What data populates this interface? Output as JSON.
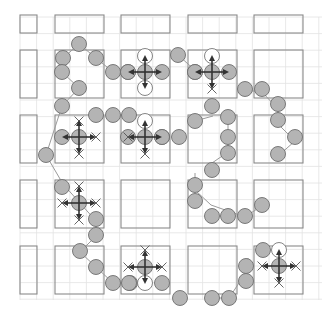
{
  "diagram": {
    "width": 333,
    "height": 325,
    "colors": {
      "background": "#ffffff",
      "grid_line": "#e2e2e2",
      "block_stroke": "#8a8a8a",
      "node_fill": "#b4b4b4",
      "node_stroke": "#6e6e6e",
      "ghost_fill": "#ffffff",
      "ghost_stroke": "#777777",
      "path_line": "#9a9a9a",
      "arrow": "#333333",
      "cross": "#555555"
    },
    "grid": {
      "x0": 20,
      "y0": 17,
      "step": 16.6,
      "x1": 322,
      "y1": 300
    },
    "blocks": [
      {
        "x": 20,
        "y": 15,
        "w": 17,
        "h": 18
      },
      {
        "x": 55,
        "y": 15,
        "w": 49,
        "h": 18
      },
      {
        "x": 121,
        "y": 15,
        "w": 49,
        "h": 18
      },
      {
        "x": 188,
        "y": 15,
        "w": 49,
        "h": 18
      },
      {
        "x": 254,
        "y": 15,
        "w": 49,
        "h": 18
      },
      {
        "x": 20,
        "y": 50,
        "w": 17,
        "h": 48
      },
      {
        "x": 55,
        "y": 50,
        "w": 49,
        "h": 48
      },
      {
        "x": 121,
        "y": 50,
        "w": 49,
        "h": 48
      },
      {
        "x": 188,
        "y": 50,
        "w": 49,
        "h": 48
      },
      {
        "x": 254,
        "y": 50,
        "w": 49,
        "h": 48
      },
      {
        "x": 20,
        "y": 115,
        "w": 17,
        "h": 48
      },
      {
        "x": 55,
        "y": 115,
        "w": 49,
        "h": 48
      },
      {
        "x": 121,
        "y": 115,
        "w": 49,
        "h": 48
      },
      {
        "x": 188,
        "y": 115,
        "w": 49,
        "h": 48
      },
      {
        "x": 254,
        "y": 115,
        "w": 49,
        "h": 48
      },
      {
        "x": 20,
        "y": 180,
        "w": 17,
        "h": 48
      },
      {
        "x": 55,
        "y": 180,
        "w": 49,
        "h": 48
      },
      {
        "x": 121,
        "y": 180,
        "w": 49,
        "h": 48
      },
      {
        "x": 188,
        "y": 180,
        "w": 49,
        "h": 48
      },
      {
        "x": 254,
        "y": 180,
        "w": 49,
        "h": 48
      },
      {
        "x": 20,
        "y": 246,
        "w": 17,
        "h": 48
      },
      {
        "x": 55,
        "y": 246,
        "w": 49,
        "h": 48
      },
      {
        "x": 121,
        "y": 246,
        "w": 49,
        "h": 48
      },
      {
        "x": 188,
        "y": 246,
        "w": 49,
        "h": 48
      },
      {
        "x": 254,
        "y": 246,
        "w": 49,
        "h": 48
      }
    ],
    "path_nodes": [
      [
        63,
        72
      ],
      [
        62,
        88
      ],
      [
        79,
        102
      ],
      [
        79,
        44
      ],
      [
        96,
        58
      ],
      [
        113,
        72
      ],
      [
        295,
        176
      ],
      [
        278,
        192
      ],
      [
        263,
        205
      ],
      [
        245,
        217
      ],
      [
        46,
        168
      ],
      [
        63,
        184
      ],
      [
        96,
        221
      ],
      [
        96,
        236
      ],
      [
        80,
        252
      ],
      [
        96,
        267
      ],
      [
        113,
        283
      ],
      [
        130,
        283
      ],
      [
        179,
        297
      ],
      [
        212,
        298
      ],
      [
        229,
        298
      ],
      [
        245,
        274
      ],
      [
        245,
        266
      ],
      [
        248,
        258
      ],
      [
        264,
        252
      ],
      [
        178,
        55
      ],
      [
        197,
        72
      ],
      [
        245,
        92
      ],
      [
        262,
        92
      ],
      [
        278,
        109
      ],
      [
        278,
        124
      ],
      [
        295,
        141
      ],
      [
        278,
        156
      ],
      [
        213,
        116
      ],
      [
        193,
        121
      ],
      [
        228,
        121
      ],
      [
        228,
        137
      ],
      [
        228,
        152
      ],
      [
        212,
        163
      ],
      [
        195,
        173
      ],
      [
        195,
        190
      ],
      [
        211,
        205
      ],
      [
        96,
        118
      ],
      [
        113,
        118
      ],
      [
        130,
        118
      ],
      [
        146,
        137
      ],
      [
        62,
        140
      ],
      [
        46,
        155
      ]
    ],
    "path_edges": [
      [
        [
          79,
          44
        ],
        [
          63,
          58
        ]
      ],
      [
        [
          79,
          44
        ],
        [
          96,
          58
        ]
      ],
      [
        [
          63,
          58
        ],
        [
          62,
          72
        ]
      ],
      [
        [
          62,
          72
        ],
        [
          79,
          88
        ]
      ],
      [
        [
          79,
          88
        ],
        [
          62,
          106
        ]
      ],
      [
        [
          62,
          106
        ],
        [
          46,
          155
        ]
      ],
      [
        [
          96,
          58
        ],
        [
          113,
          72
        ]
      ],
      [
        [
          178,
          55
        ],
        [
          197,
          72
        ]
      ],
      [
        [
          237,
          89
        ],
        [
          262,
          92
        ]
      ],
      [
        [
          262,
          92
        ],
        [
          278,
          109
        ]
      ],
      [
        [
          278,
          109
        ],
        [
          278,
          124
        ]
      ],
      [
        [
          278,
          124
        ],
        [
          295,
          141
        ]
      ],
      [
        [
          295,
          141
        ],
        [
          278,
          156
        ]
      ],
      [
        [
          46,
          155
        ],
        [
          63,
          184
        ]
      ],
      [
        [
          63,
          184
        ],
        [
          96,
          221
        ]
      ],
      [
        [
          96,
          221
        ],
        [
          96,
          236
        ]
      ],
      [
        [
          96,
          236
        ],
        [
          80,
          252
        ]
      ],
      [
        [
          80,
          252
        ],
        [
          96,
          267
        ]
      ],
      [
        [
          96,
          267
        ],
        [
          113,
          283
        ]
      ],
      [
        [
          213,
          116
        ],
        [
          195,
          121
        ]
      ],
      [
        [
          228,
          121
        ],
        [
          228,
          152
        ]
      ],
      [
        [
          228,
          152
        ],
        [
          212,
          163
        ]
      ],
      [
        [
          195,
          173
        ],
        [
          195,
          190
        ]
      ],
      [
        [
          195,
          190
        ],
        [
          211,
          205
        ]
      ],
      [
        [
          211,
          205
        ],
        [
          245,
          217
        ]
      ],
      [
        [
          245,
          217
        ],
        [
          263,
          205
        ]
      ],
      [
        [
          212,
          298
        ],
        [
          229,
          298
        ]
      ],
      [
        [
          229,
          298
        ],
        [
          245,
          274
        ]
      ],
      [
        [
          245,
          274
        ],
        [
          248,
          258
        ]
      ]
    ],
    "nodes": [
      {
        "x": 79,
        "y": 44
      },
      {
        "x": 63,
        "y": 58
      },
      {
        "x": 96,
        "y": 58
      },
      {
        "x": 62,
        "y": 72
      },
      {
        "x": 79,
        "y": 88
      },
      {
        "x": 62,
        "y": 106
      },
      {
        "x": 113,
        "y": 72
      },
      {
        "x": 128,
        "y": 72
      },
      {
        "x": 178,
        "y": 55
      },
      {
        "x": 195,
        "y": 72
      },
      {
        "x": 245,
        "y": 89
      },
      {
        "x": 262,
        "y": 89
      },
      {
        "x": 278,
        "y": 104
      },
      {
        "x": 278,
        "y": 120
      },
      {
        "x": 295,
        "y": 137
      },
      {
        "x": 278,
        "y": 154
      },
      {
        "x": 212,
        "y": 106
      },
      {
        "x": 195,
        "y": 121
      },
      {
        "x": 228,
        "y": 117
      },
      {
        "x": 228,
        "y": 137
      },
      {
        "x": 228,
        "y": 153
      },
      {
        "x": 212,
        "y": 170
      },
      {
        "x": 195,
        "y": 185
      },
      {
        "x": 195,
        "y": 201
      },
      {
        "x": 212,
        "y": 216
      },
      {
        "x": 228,
        "y": 216
      },
      {
        "x": 245,
        "y": 216
      },
      {
        "x": 262,
        "y": 205
      },
      {
        "x": 96,
        "y": 115
      },
      {
        "x": 113,
        "y": 115
      },
      {
        "x": 129,
        "y": 115
      },
      {
        "x": 179,
        "y": 137
      },
      {
        "x": 46,
        "y": 155
      },
      {
        "x": 62,
        "y": 187
      },
      {
        "x": 96,
        "y": 219
      },
      {
        "x": 96,
        "y": 235
      },
      {
        "x": 80,
        "y": 251
      },
      {
        "x": 96,
        "y": 267
      },
      {
        "x": 113,
        "y": 283
      },
      {
        "x": 130,
        "y": 283
      },
      {
        "x": 180,
        "y": 298
      },
      {
        "x": 212,
        "y": 298
      },
      {
        "x": 229,
        "y": 298
      },
      {
        "x": 246,
        "y": 281
      },
      {
        "x": 246,
        "y": 266
      },
      {
        "x": 263,
        "y": 250
      }
    ],
    "robots": [
      {
        "x": 145,
        "y": 72,
        "ghosts": [
          {
            "x": 145,
            "y": 56
          },
          {
            "x": 145,
            "y": 88
          }
        ],
        "side_nodes": [
          {
            "x": 128,
            "y": 72
          },
          {
            "x": 162,
            "y": 72
          }
        ],
        "crosses": []
      },
      {
        "x": 212,
        "y": 72,
        "ghosts": [
          {
            "x": 212,
            "y": 56
          }
        ],
        "side_nodes": [
          {
            "x": 195,
            "y": 72
          },
          {
            "x": 229,
            "y": 72
          }
        ],
        "crosses": [
          {
            "x": 212,
            "y": 89
          }
        ]
      },
      {
        "x": 79,
        "y": 137,
        "ghosts": [],
        "side_nodes": [
          {
            "x": 62,
            "y": 137
          }
        ],
        "crosses": [
          {
            "x": 79,
            "y": 121
          },
          {
            "x": 79,
            "y": 154
          },
          {
            "x": 96,
            "y": 137
          }
        ]
      },
      {
        "x": 145,
        "y": 137,
        "ghosts": [
          {
            "x": 145,
            "y": 121
          }
        ],
        "side_nodes": [
          {
            "x": 162,
            "y": 137
          }
        ],
        "crosses": [
          {
            "x": 128,
            "y": 137
          },
          {
            "x": 145,
            "y": 154
          }
        ]
      },
      {
        "x": 79,
        "y": 203,
        "ghosts": [],
        "side_nodes": [],
        "crosses": [
          {
            "x": 79,
            "y": 186
          },
          {
            "x": 62,
            "y": 203
          },
          {
            "x": 96,
            "y": 203
          },
          {
            "x": 79,
            "y": 220
          }
        ]
      },
      {
        "x": 145,
        "y": 267,
        "ghosts": [
          {
            "x": 145,
            "y": 283
          }
        ],
        "side_nodes": [
          {
            "x": 162,
            "y": 283
          }
        ],
        "crosses": [
          {
            "x": 145,
            "y": 250
          },
          {
            "x": 128,
            "y": 267
          },
          {
            "x": 162,
            "y": 267
          }
        ]
      },
      {
        "x": 279,
        "y": 266,
        "ghosts": [
          {
            "x": 279,
            "y": 250
          }
        ],
        "side_nodes": [],
        "crosses": [
          {
            "x": 262,
            "y": 266
          },
          {
            "x": 296,
            "y": 266
          },
          {
            "x": 279,
            "y": 283
          }
        ]
      }
    ],
    "extra_nodes": [
      {
        "x": 128,
        "y": 137
      },
      {
        "x": 162,
        "y": 137
      },
      {
        "x": 129,
        "y": 283
      }
    ]
  }
}
